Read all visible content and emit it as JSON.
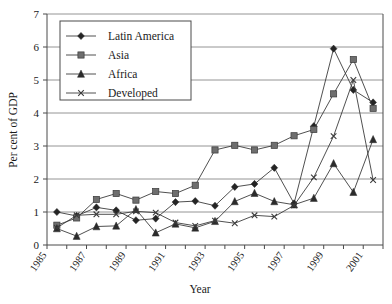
{
  "chart_data": {
    "type": "line",
    "title": "",
    "xlabel": "Year",
    "ylabel": "Per cent of GDP",
    "xlim": [
      1985,
      2002
    ],
    "ylim": [
      0,
      7
    ],
    "yticks": [
      0,
      1,
      2,
      3,
      4,
      5,
      6,
      7
    ],
    "xticks": [
      1985,
      1986,
      1987,
      1988,
      1989,
      1990,
      1991,
      1992,
      1993,
      1994,
      1995,
      1996,
      1997,
      1998,
      1999,
      2000,
      2001,
      2002
    ],
    "xtick_labels": [
      "1985",
      "",
      "1987",
      "",
      "1989",
      "",
      "1991",
      "",
      "1993",
      "",
      "1995",
      "",
      "1997",
      "",
      "1999",
      "",
      "2001",
      ""
    ],
    "grid": "horizontal",
    "legend_position": "top-left",
    "x": [
      1985.5,
      1986.5,
      1987.5,
      1988.5,
      1989.5,
      1990.5,
      1991.5,
      1992.5,
      1993.5,
      1994.5,
      1995.5,
      1996.5,
      1997.5,
      1998.5,
      1999.5,
      2000.5,
      2001.5
    ],
    "series": [
      {
        "name": "Latin America",
        "marker": "diamond",
        "values": [
          1.0,
          0.88,
          1.14,
          1.05,
          0.75,
          0.8,
          1.3,
          1.33,
          1.19,
          1.76,
          1.85,
          2.34,
          1.26,
          3.6,
          5.95,
          4.7,
          4.32
        ]
      },
      {
        "name": "Asia",
        "marker": "square",
        "values": [
          0.6,
          0.82,
          1.38,
          1.56,
          1.36,
          1.62,
          1.56,
          1.81,
          2.88,
          3.02,
          2.88,
          3.02,
          3.31,
          3.5,
          4.58,
          5.62,
          4.14
        ]
      },
      {
        "name": "Africa",
        "marker": "triangle",
        "values": [
          0.5,
          0.27,
          0.56,
          0.58,
          1.08,
          0.37,
          0.64,
          0.52,
          0.72,
          1.32,
          1.57,
          1.32,
          1.22,
          1.42,
          2.47,
          1.6,
          3.2
        ]
      },
      {
        "name": "Developed",
        "marker": "x",
        "values": [
          0.52,
          0.9,
          0.93,
          0.93,
          1.02,
          0.98,
          0.68,
          0.58,
          0.74,
          0.66,
          0.9,
          0.86,
          1.2,
          2.05,
          3.3,
          5.0,
          1.97
        ]
      }
    ]
  },
  "legend": {
    "items": [
      {
        "label": "Latin America",
        "marker": "diamond-marker"
      },
      {
        "label": "Asia",
        "marker": "square-marker"
      },
      {
        "label": "Africa",
        "marker": "triangle-marker"
      },
      {
        "label": "Developed",
        "marker": "x-marker"
      }
    ]
  },
  "axes": {
    "y_title": "Per cent of GDP",
    "x_title": "Year",
    "y_tick_labels": [
      "0",
      "1",
      "2",
      "3",
      "4",
      "5",
      "6",
      "7"
    ],
    "x_tick_labels": [
      "1985",
      "1987",
      "1989",
      "1991",
      "1993",
      "1995",
      "1997",
      "1999",
      "2001"
    ]
  },
  "colors": {
    "grid": "#7a7a7a",
    "axis": "#4a4a4a",
    "line": "#3c3c3c",
    "diamond": "#242424",
    "square": "#6e6e6e",
    "triangle": "#2b2b2b",
    "cross": "#3a3a3a",
    "background": "#ffffff"
  }
}
